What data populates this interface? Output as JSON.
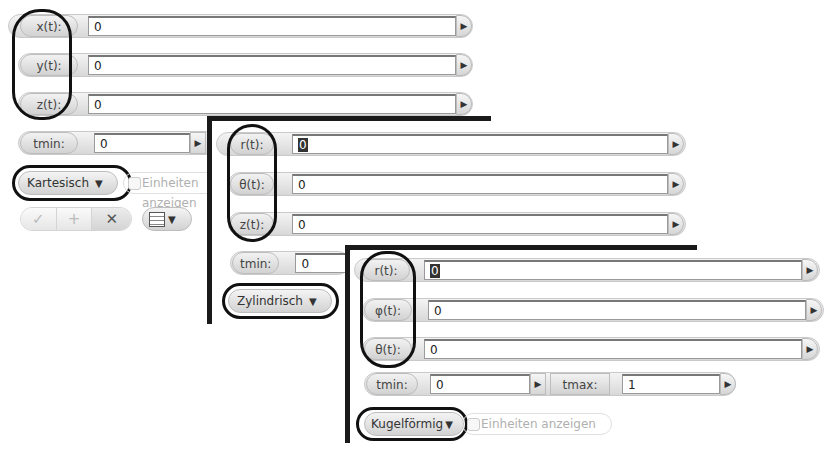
{
  "panels": {
    "cartesian": {
      "rows": [
        {
          "label": "x(t):",
          "value": "0"
        },
        {
          "label": "y(t):",
          "value": "0"
        },
        {
          "label": "z(t):",
          "value": "0"
        }
      ],
      "tmin": {
        "label": "tmin:",
        "value": "0"
      },
      "coord_system": "Kartesisch",
      "units_label": "Einheiten anzeigen",
      "buttons": {
        "check": "✓",
        "add": "+",
        "remove": "✕"
      }
    },
    "cylindrical": {
      "rows": [
        {
          "label": "r(t):",
          "value": "0"
        },
        {
          "label": "θ(t):",
          "value": "0"
        },
        {
          "label": "z(t):",
          "value": "0"
        }
      ],
      "tmin": {
        "label": "tmin:",
        "value": "0"
      },
      "coord_system": "Zylindrisch"
    },
    "spherical": {
      "rows": [
        {
          "label": "r(t):",
          "value": "0"
        },
        {
          "label": "φ(t):",
          "value": "0"
        },
        {
          "label": "θ(t):",
          "value": "0"
        }
      ],
      "tmin": {
        "label": "tmin:",
        "value": "0"
      },
      "tmax": {
        "label": "tmax:",
        "value": "1"
      },
      "coord_system": "Kugelförmig",
      "units_label": "Einheiten anzeigen"
    }
  },
  "icons": {
    "arrow": "▶",
    "dropdown": "▼"
  }
}
